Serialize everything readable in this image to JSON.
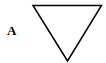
{
  "figure": {
    "label": "A",
    "shape": {
      "type": "inverted-triangle",
      "stroke_color": "#000000",
      "fill_color": "#ffffff",
      "stroke_width": 1.5,
      "points": [
        [
          33,
          5.5
        ],
        [
          101.5,
          5.5
        ],
        [
          67.5,
          61
        ]
      ]
    }
  }
}
